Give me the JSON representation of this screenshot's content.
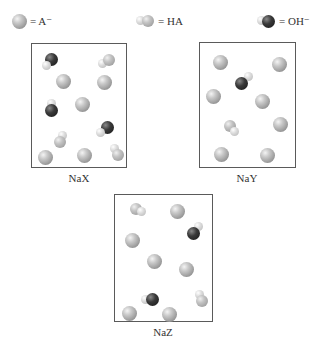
{
  "legend": [
    {
      "symbol": "A-",
      "label": "= A⁻",
      "icon": "a-minus-sphere-icon"
    },
    {
      "symbol": "HA",
      "label": "= HA",
      "icon": "ha-molecule-icon"
    },
    {
      "symbol": "OH-",
      "label": "= OH⁻",
      "icon": "oh-minus-molecule-icon"
    }
  ],
  "boxes": [
    {
      "label": "NaX",
      "counts": {
        "A-": 6,
        "HA": 3,
        "OH-": 3
      }
    },
    {
      "label": "NaY",
      "counts": {
        "A-": 8,
        "HA": 1,
        "OH-": 1
      }
    },
    {
      "label": "NaZ",
      "counts": {
        "A-": 7,
        "HA": 2,
        "OH-": 2
      }
    }
  ],
  "colors": {
    "a_minus": "#a8a8a8",
    "hydrogen": "#d8d8d8",
    "oxygen": "#2a2a2a",
    "border": "#5a5a5a"
  }
}
